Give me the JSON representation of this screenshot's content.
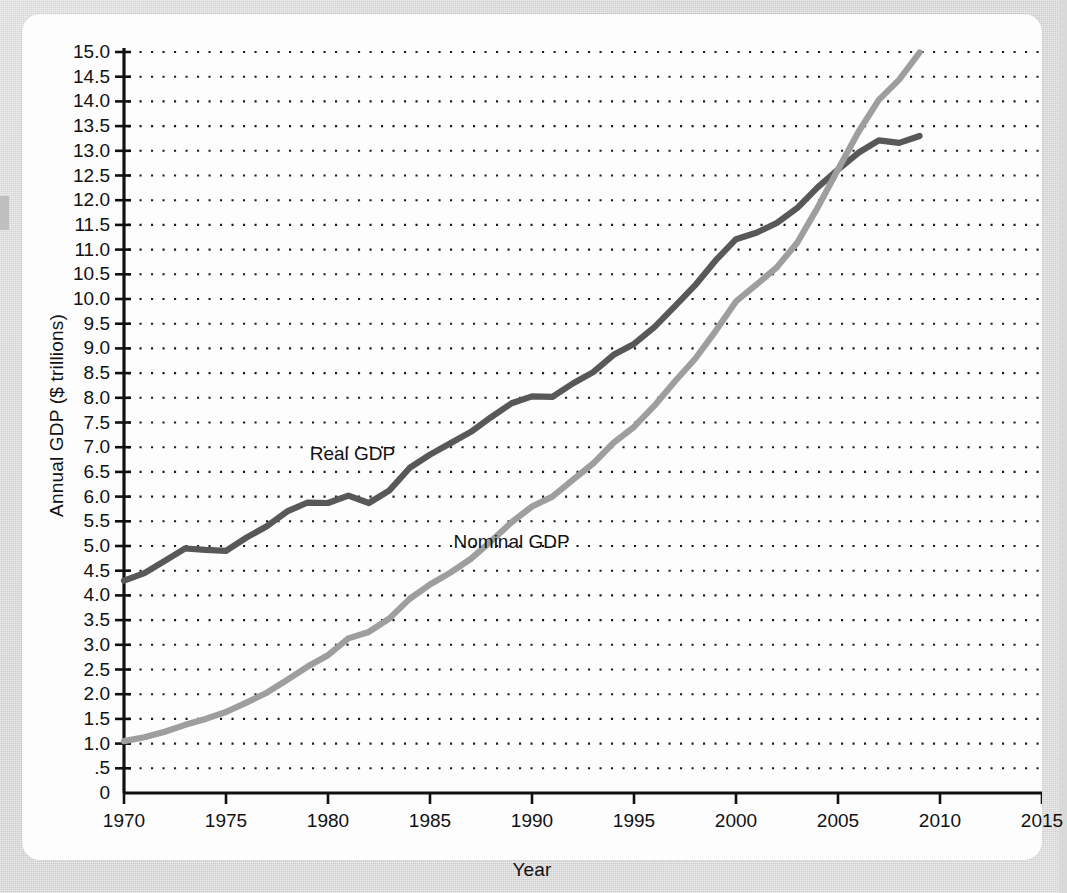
{
  "figure": {
    "y_axis_title": "Annual GDP ($ trillions)",
    "x_axis_title": "Year"
  },
  "colors": {
    "real_gdp_line": "#585858",
    "nominal_gdp_line": "#9e9e9e",
    "axis": "#111111",
    "gridline": "#1a1a1a",
    "page": "#fdfdfd",
    "backdrop": "#d9d9d9"
  },
  "annotations": {
    "real_gdp_label": "Real GDP",
    "nominal_gdp_label": "Nominal GDP"
  },
  "chart_data": {
    "type": "line",
    "title": "",
    "xlabel": "Year",
    "ylabel": "Annual GDP ($ trillions)",
    "xlim": [
      1970,
      2015
    ],
    "ylim": [
      0,
      15
    ],
    "grid": "horizontal-dotted",
    "legend": "inline-annotations",
    "x_tick_labels": [
      "1970",
      "1975",
      "1980",
      "1985",
      "1990",
      "1995",
      "2000",
      "2005",
      "2010",
      "2015"
    ],
    "x_ticks": [
      1970,
      1975,
      1980,
      1985,
      1990,
      1995,
      2000,
      2005,
      2010,
      2015
    ],
    "y_tick_labels": [
      "0",
      ".5",
      "1.0",
      "1.5",
      "2.0",
      "2.5",
      "3.0",
      "3.5",
      "4.0",
      "4.5",
      "5.0",
      "5.5",
      "6.0",
      "6.5",
      "7.0",
      "7.5",
      "8.0",
      "8.5",
      "9.0",
      "9.5",
      "10.0",
      "10.5",
      "11.0",
      "11.5",
      "12.0",
      "12.5",
      "13.0",
      "13.5",
      "14.0",
      "14.5",
      "15.0"
    ],
    "y_ticks": [
      0,
      0.5,
      1.0,
      1.5,
      2.0,
      2.5,
      3.0,
      3.5,
      4.0,
      4.5,
      5.0,
      5.5,
      6.0,
      6.5,
      7.0,
      7.5,
      8.0,
      8.5,
      9.0,
      9.5,
      10.0,
      10.5,
      11.0,
      11.5,
      12.0,
      12.5,
      13.0,
      13.5,
      14.0,
      14.5,
      15.0
    ],
    "x": [
      1970,
      1971,
      1972,
      1973,
      1974,
      1975,
      1976,
      1977,
      1978,
      1979,
      1980,
      1981,
      1982,
      1983,
      1984,
      1985,
      1986,
      1987,
      1988,
      1989,
      1990,
      1991,
      1992,
      1993,
      1994,
      1995,
      1996,
      1997,
      1998,
      1999,
      2000,
      2001,
      2002,
      2003,
      2004,
      2005,
      2006,
      2007,
      2008,
      2009
    ],
    "series": [
      {
        "name": "Real GDP",
        "color": "#585858",
        "values": [
          4.3,
          4.45,
          4.7,
          4.95,
          4.92,
          4.9,
          5.17,
          5.4,
          5.7,
          5.88,
          5.87,
          6.02,
          5.87,
          6.12,
          6.58,
          6.85,
          7.08,
          7.31,
          7.61,
          7.89,
          8.03,
          8.02,
          8.29,
          8.52,
          8.87,
          9.09,
          9.43,
          9.85,
          10.28,
          10.78,
          11.21,
          11.34,
          11.54,
          11.84,
          12.26,
          12.62,
          12.96,
          13.21,
          13.16,
          13.3
        ]
      },
      {
        "name": "Nominal GDP",
        "color": "#9e9e9e",
        "values": [
          1.05,
          1.13,
          1.24,
          1.38,
          1.5,
          1.64,
          1.83,
          2.03,
          2.29,
          2.56,
          2.79,
          3.13,
          3.26,
          3.53,
          3.93,
          4.22,
          4.46,
          4.74,
          5.1,
          5.48,
          5.8,
          6.0,
          6.34,
          6.67,
          7.09,
          7.41,
          7.84,
          8.33,
          8.79,
          9.35,
          9.95,
          10.29,
          10.64,
          11.14,
          11.85,
          12.62,
          13.38,
          14.03,
          14.44,
          14.99
        ]
      }
    ],
    "annotations": [
      {
        "text": "Real GDP",
        "x": 1981.2,
        "y": 6.75
      },
      {
        "text": "Nominal GDP",
        "x": 1989.0,
        "y": 4.95
      }
    ]
  }
}
